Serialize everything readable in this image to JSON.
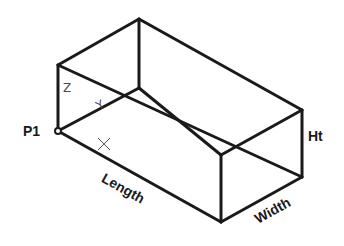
{
  "diagram": {
    "labels": {
      "point": "P1",
      "length": "Length",
      "width": "Width",
      "height": "Ht",
      "axis_z": "Z",
      "axis_y": "Y"
    },
    "colors": {
      "edge": "#1a1a1a",
      "axis_text": "#4a4a4a",
      "background": "#ffffff"
    }
  }
}
